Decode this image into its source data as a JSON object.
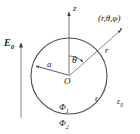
{
  "figure": {
    "background_color": "#ffffff",
    "stroke_color": "#3a3a3a",
    "text_color": "#1a1a1a",
    "width": 140,
    "height": 134
  },
  "labels": {
    "z_axis": "z",
    "field": "E",
    "field_sub": "0",
    "field_full": "E0",
    "radius": "a",
    "angle": "θ",
    "radial_distance": "r",
    "origin": "O",
    "field_point": "(r,θ,φ)",
    "permittivity_inside": "ε",
    "permittivity_outside": "ε",
    "permittivity_outside_sub": "0",
    "potential_inside": "Φ",
    "potential_inside_sub": "1",
    "potential_outside": "Φ",
    "potential_outside_sub": "2"
  },
  "geometry": {
    "sphere_center": {
      "x": 69,
      "y": 76
    },
    "sphere_radius": 38,
    "z_axis": {
      "x": 69,
      "top_y": 10,
      "bottom_y": 76
    },
    "radius_arrow": {
      "from_x": 69,
      "from_y": 76,
      "to_x": 35,
      "to_y": 65
    },
    "radial_line": {
      "from_x": 69,
      "from_y": 76,
      "to_x": 122,
      "to_y": 29
    },
    "field_arrow": {
      "x": 21,
      "bottom_y": 118,
      "top_y": 41
    },
    "angle_arc_radius": 20
  }
}
